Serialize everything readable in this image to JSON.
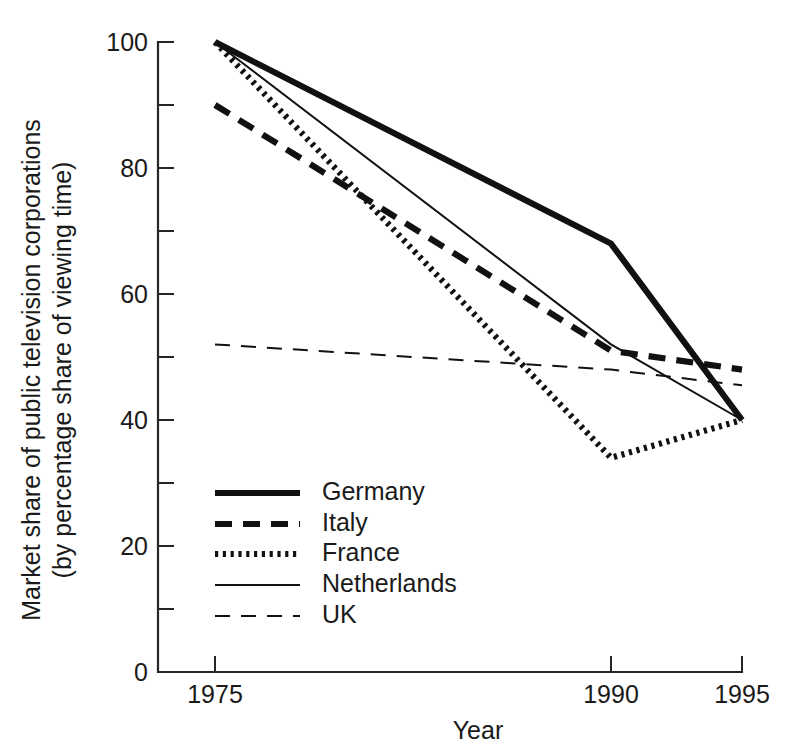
{
  "chart_data": {
    "type": "line",
    "title": "",
    "xlabel": "Year",
    "ylabel": "Market share of public television corporations (by percentage share of viewing time)",
    "ylabel_line1": "Market share of public television corporations",
    "ylabel_line2": "(by percentage share of viewing time)",
    "x": [
      1975,
      1990,
      1995
    ],
    "categories": [
      "1975",
      "1990",
      "1995"
    ],
    "xtick_labels": [
      "1975",
      "1990",
      "1995"
    ],
    "ytick_labels": [
      "0",
      "20",
      "40",
      "60",
      "80",
      "100"
    ],
    "ytick_values": [
      0,
      20,
      40,
      60,
      80,
      100
    ],
    "yminor_values": [
      10,
      30,
      50,
      70,
      90
    ],
    "ylim": [
      0,
      100
    ],
    "xlim": [
      1975,
      1995
    ],
    "grid": false,
    "legend_position": "inside-lower-left",
    "series": [
      {
        "name": "Germany",
        "style": "solid-thick",
        "color": "#111111",
        "values": [
          100,
          68,
          40
        ]
      },
      {
        "name": "Italy",
        "style": "dashed-thick",
        "color": "#111111",
        "values": [
          90,
          51,
          48
        ]
      },
      {
        "name": "France",
        "style": "dotted-thick",
        "color": "#111111",
        "values": [
          100,
          34,
          40
        ]
      },
      {
        "name": "Netherlands",
        "style": "solid-thin",
        "color": "#111111",
        "values": [
          100,
          52,
          40
        ]
      },
      {
        "name": "UK",
        "style": "dashed-thin",
        "color": "#111111",
        "values": [
          52,
          48,
          45.5
        ]
      }
    ]
  },
  "legend": {
    "entries": [
      {
        "label": "Germany"
      },
      {
        "label": "Italy"
      },
      {
        "label": "France"
      },
      {
        "label": "Netherlands"
      },
      {
        "label": "UK"
      }
    ]
  }
}
